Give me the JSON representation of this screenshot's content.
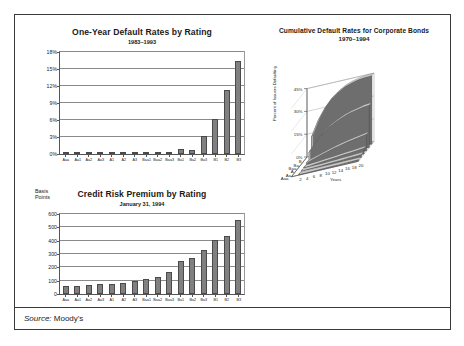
{
  "figure": {
    "source_prefix": "Source:",
    "source_value": " Moody's"
  },
  "chart_data": [
    {
      "type": "bar",
      "title": "One-Year Default Rates by Rating",
      "subtitle": "1983–1993",
      "xlabel": "",
      "ylabel": "",
      "ylim": [
        0,
        18
      ],
      "yticks": [
        0,
        3,
        6,
        9,
        12,
        15,
        18
      ],
      "ytick_labels": [
        "0%",
        "3%",
        "6%",
        "9%",
        "12%",
        "15%",
        "18%"
      ],
      "grid": true,
      "categories": [
        "Aaa",
        "Aa1",
        "Aa2",
        "Aa3",
        "A1",
        "A2",
        "A3",
        "Baa1",
        "Baa2",
        "Baa3",
        "Ba1",
        "Ba2",
        "Ba3",
        "B1",
        "B2",
        "B3"
      ],
      "values": [
        0.0,
        0.0,
        0.0,
        0.1,
        0.0,
        0.0,
        0.05,
        0.15,
        0.3,
        0.25,
        0.9,
        0.75,
        3.1,
        6.2,
        11.3,
        16.5
      ]
    },
    {
      "type": "bar",
      "title": "Credit Risk Premium by Rating",
      "subtitle": "January 31, 1994",
      "axis_name": "Basis\nPoints",
      "axis_name_line1": "Basis",
      "axis_name_line2": "Points",
      "xlabel": "",
      "ylabel": "Basis Points",
      "ylim": [
        0,
        600
      ],
      "yticks": [
        0,
        100,
        200,
        300,
        400,
        500,
        600
      ],
      "ytick_labels": [
        "0",
        "100",
        "200",
        "300",
        "400",
        "500",
        "600"
      ],
      "grid": true,
      "categories": [
        "Aaa",
        "Aa1",
        "Aa2",
        "Aa3",
        "A1",
        "A2",
        "A3",
        "Baa1",
        "Baa2",
        "Baa3",
        "Ba1",
        "Ba2",
        "Ba3",
        "B1",
        "B2",
        "B3"
      ],
      "values": [
        58,
        58,
        68,
        75,
        78,
        82,
        97,
        112,
        125,
        168,
        245,
        272,
        330,
        405,
        437,
        553
      ]
    },
    {
      "type": "area",
      "title": "Cumulative Default Rates for Corporate Bonds",
      "subtitle": "1970–1994",
      "projection": "3d-ribbon",
      "xlabel": "Years",
      "ylabel": "Percent of Issuers Defaulting",
      "zlabel": "",
      "ylim": [
        0,
        45
      ],
      "yticks": [
        0,
        15,
        30,
        45
      ],
      "ytick_labels": [
        "0%",
        "15%",
        "30%",
        "45%"
      ],
      "x": [
        2,
        4,
        6,
        8,
        10,
        12,
        14,
        16,
        18,
        20
      ],
      "xtick_labels": [
        "2",
        "4",
        "6",
        "8",
        "10",
        "12",
        "14",
        "16",
        "18",
        "20"
      ],
      "depth_categories": [
        "B",
        "Ba",
        "Baa",
        "A",
        "Aa",
        "Aaa"
      ],
      "series": [
        {
          "name": "B",
          "values": [
            14.0,
            24.0,
            31.0,
            36.0,
            39.5,
            42.0,
            43.5,
            44.5,
            45.0,
            45.2
          ]
        },
        {
          "name": "Ba",
          "values": [
            6.0,
            11.5,
            16.0,
            19.5,
            22.0,
            24.0,
            25.5,
            26.5,
            27.5,
            28.0
          ]
        },
        {
          "name": "Baa",
          "values": [
            1.2,
            2.6,
            4.0,
            5.3,
            6.5,
            7.6,
            8.6,
            9.4,
            10.2,
            11.0
          ]
        },
        {
          "name": "A",
          "values": [
            0.3,
            0.7,
            1.1,
            1.5,
            1.9,
            2.3,
            2.7,
            3.1,
            3.5,
            3.9
          ]
        },
        {
          "name": "Aa",
          "values": [
            0.2,
            0.4,
            0.6,
            0.8,
            1.0,
            1.2,
            1.4,
            1.6,
            1.8,
            2.0
          ]
        },
        {
          "name": "Aaa",
          "values": [
            0.0,
            0.1,
            0.2,
            0.3,
            0.4,
            0.5,
            0.6,
            0.7,
            0.8,
            0.9
          ]
        }
      ]
    }
  ],
  "colors": {
    "bar_fill": "#808080",
    "bar_edge": "#4a4a4a",
    "ribbon_face": "#6e6e6e",
    "ribbon_top": "#d8d8d8",
    "frame": "#3a3a3a",
    "grid": "#8a8a8a"
  }
}
